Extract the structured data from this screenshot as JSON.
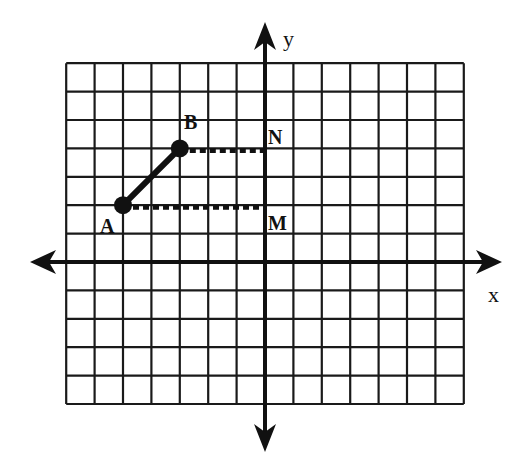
{
  "diagram": {
    "type": "coordinate-grid",
    "grid": {
      "columns": 14,
      "rows": 12,
      "x_range": [
        -7,
        7
      ],
      "y_range": [
        -5,
        7
      ],
      "origin_px": [
        265,
        262
      ],
      "unit_px": 28.4,
      "line_color": "#1a1a1a"
    },
    "axes": {
      "x_label": "x",
      "y_label": "y"
    },
    "points": [
      {
        "id": "A",
        "label": "A",
        "x": -5,
        "y": 2,
        "filled": true
      },
      {
        "id": "B",
        "label": "B",
        "x": -3,
        "y": 4,
        "filled": true
      },
      {
        "id": "N",
        "label": "N",
        "x": 0,
        "y": 4,
        "filled": false
      },
      {
        "id": "M",
        "label": "M",
        "x": 0,
        "y": 2,
        "filled": false
      }
    ],
    "segments": [
      {
        "from": "A",
        "to": "B",
        "style": "solid-thick"
      },
      {
        "from": "B",
        "to": "N",
        "style": "dotted"
      },
      {
        "from": "A",
        "to": "M",
        "style": "dotted"
      }
    ]
  }
}
